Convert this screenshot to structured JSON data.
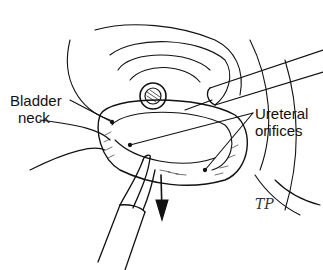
{
  "figure": {
    "type": "surgical illustration",
    "style": "black line art",
    "labels": [
      {
        "id": "bladder-neck",
        "line1": "Bladder",
        "line2": "neck"
      },
      {
        "id": "ureteral-orifices",
        "line1": "Ureteral",
        "line2": "orifices"
      }
    ],
    "signature": "TP",
    "colors": {
      "ink": "#111111",
      "background": "#ffffff"
    }
  }
}
